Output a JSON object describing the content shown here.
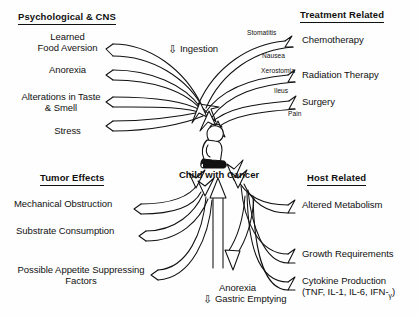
{
  "figure": {
    "center": {
      "label": "Child with Cancer",
      "icon": "seated-child-figure"
    },
    "quadrants": {
      "top_left": {
        "header": "Psychological & CNS",
        "items": [
          "Learned\nFood Aversion",
          "Anorexia",
          "Alterations in Taste\n& Smell",
          "Stress"
        ]
      },
      "top_right": {
        "header": "Treatment Related",
        "items": [
          "Chemotherapy",
          "Radiation Therapy",
          "Surgery"
        ],
        "annotations": [
          "Stomatitis",
          "Nausea",
          "Xerostomia",
          "Ileus",
          "Pain"
        ]
      },
      "bottom_left": {
        "header": "Tumor Effects",
        "items": [
          "Mechanical Obstruction",
          "Substrate Consumption",
          "Possible Appetite Suppressing\nFactors"
        ]
      },
      "bottom_right": {
        "header": "Host Related",
        "items": [
          "Altered Metabolism",
          "Growth Requirements",
          "Cytokine Production\n(TNF, IL-1, IL-6, IFN-γ)"
        ]
      }
    },
    "pathways": {
      "ingestion": {
        "direction_glyph": "⇩",
        "label": "Ingestion"
      },
      "anorexia_gastric": {
        "line1": "Anorexia",
        "direction_glyph": "⇩",
        "line2": "Gastric Emptying"
      }
    },
    "colors": {
      "ink": "#111111",
      "paper": "#fefefe"
    }
  }
}
